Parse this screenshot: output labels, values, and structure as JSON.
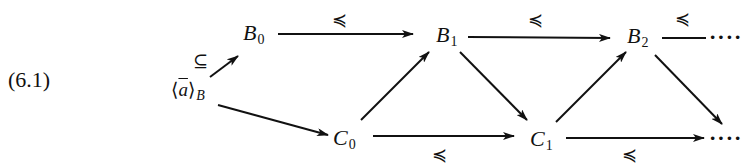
{
  "equation_number": "(6.1)",
  "nodes": {
    "a_B": {
      "left": "⟨",
      "var": "a",
      "right": "⟩",
      "sub": "B"
    },
    "B0": {
      "base": "B",
      "sub": "0"
    },
    "B1": {
      "base": "B",
      "sub": "1"
    },
    "B2": {
      "base": "B",
      "sub": "2"
    },
    "C0": {
      "base": "C",
      "sub": "0"
    },
    "C1": {
      "base": "C",
      "sub": "1"
    },
    "cont_top": "····",
    "cont_bottom": "····"
  },
  "edge_labels": {
    "aB_to_B0": "⊆",
    "B0_to_B1": "≼",
    "B1_to_B2": "≼",
    "B2_to_cont": "≼",
    "C0_to_C1": "≼",
    "C1_to_cont": "≼"
  },
  "edges": [
    {
      "from": "a_B",
      "to": "B0",
      "label": "⊆"
    },
    {
      "from": "a_B",
      "to": "C0"
    },
    {
      "from": "B0",
      "to": "B1",
      "label": "≼"
    },
    {
      "from": "C0",
      "to": "B1"
    },
    {
      "from": "B1",
      "to": "C1"
    },
    {
      "from": "C0",
      "to": "C1",
      "label": "≼"
    },
    {
      "from": "B1",
      "to": "B2",
      "label": "≼"
    },
    {
      "from": "C1",
      "to": "B2"
    },
    {
      "from": "B2",
      "to": "cont_bottom"
    },
    {
      "from": "C1",
      "to": "cont_bottom",
      "label": "≼"
    },
    {
      "from": "B2",
      "to": "cont_top",
      "label": "≼"
    }
  ],
  "colors": {
    "ink": "#111111",
    "background": "#ffffff"
  }
}
